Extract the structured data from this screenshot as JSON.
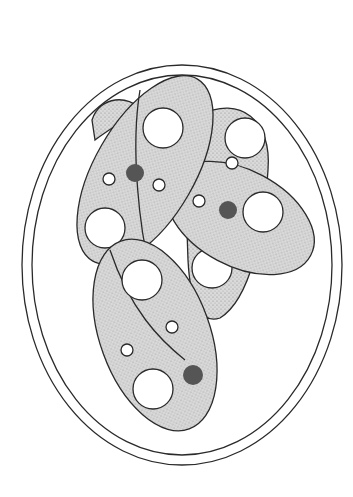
{
  "figure": {
    "colors": {
      "background": "#ffffff",
      "line": "#2a2a2a",
      "stipple": "#c8c8c8"
    },
    "elements": {
      "oocyst_wall": "double-walled ellipse",
      "sporocysts": 4,
      "residuum_clusters": 3
    }
  }
}
